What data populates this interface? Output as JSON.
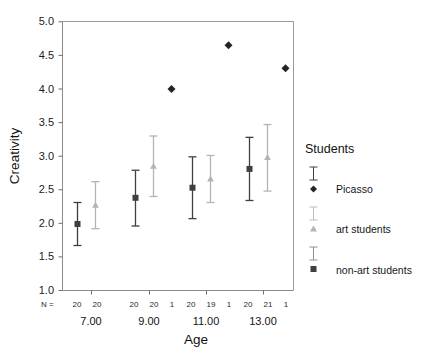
{
  "chart_data": {
    "type": "scatter",
    "title": "",
    "xlabel": "Age",
    "ylabel": "Creativity",
    "ylim": [
      1.0,
      5.0
    ],
    "ytick_labels": [
      "1.0",
      "1.5",
      "2.0",
      "2.5",
      "3.0",
      "3.5",
      "4.0",
      "4.5",
      "5.0"
    ],
    "ytick_values": [
      1.0,
      1.5,
      2.0,
      2.5,
      3.0,
      3.5,
      4.0,
      4.5,
      5.0
    ],
    "categories": [
      "7.00",
      "9.00",
      "11.00",
      "13.00"
    ],
    "grid": false,
    "legend_position": "right",
    "n_row_label": "N =",
    "n_counts": [
      [
        "20",
        "20"
      ],
      [
        "20",
        "20",
        "1"
      ],
      [
        "20",
        "19",
        "1"
      ],
      [
        "20",
        "21",
        "1"
      ]
    ],
    "series": [
      {
        "name": "non-art students",
        "marker": "square",
        "color": "#3f3f3f",
        "points": [
          {
            "category": "7.00",
            "mean": 1.99,
            "lower": 1.67,
            "upper": 2.31
          },
          {
            "category": "9.00",
            "mean": 2.38,
            "lower": 1.96,
            "upper": 2.79
          },
          {
            "category": "11.00",
            "mean": 2.53,
            "lower": 2.07,
            "upper": 2.99
          },
          {
            "category": "13.00",
            "mean": 2.81,
            "lower": 2.34,
            "upper": 3.28
          }
        ]
      },
      {
        "name": "art students",
        "marker": "triangle",
        "color": "#b4b4b4",
        "points": [
          {
            "category": "7.00",
            "mean": 2.27,
            "lower": 1.92,
            "upper": 2.62
          },
          {
            "category": "9.00",
            "mean": 2.85,
            "lower": 2.4,
            "upper": 3.3
          },
          {
            "category": "11.00",
            "mean": 2.66,
            "lower": 2.31,
            "upper": 3.01
          },
          {
            "category": "13.00",
            "mean": 2.98,
            "lower": 2.48,
            "upper": 3.47
          }
        ]
      },
      {
        "name": "Picasso",
        "marker": "diamond",
        "color": "#242424",
        "points": [
          {
            "category": "9.00",
            "mean": 4.0
          },
          {
            "category": "11.00",
            "mean": 4.65
          },
          {
            "category": "13.00",
            "mean": 4.31
          }
        ]
      }
    ]
  },
  "legend": {
    "title": "Students",
    "entries": [
      {
        "label": "Picasso",
        "marker": "diamond",
        "color": "#242424",
        "bar_color": "#3f3f3f"
      },
      {
        "label": "art students",
        "marker": "triangle",
        "color": "#b4b4b4",
        "bar_color": "#bcbcbc"
      },
      {
        "label": "non-art students",
        "marker": "square",
        "color": "#3f3f3f",
        "bar_color": "#8f8f8f"
      }
    ]
  }
}
